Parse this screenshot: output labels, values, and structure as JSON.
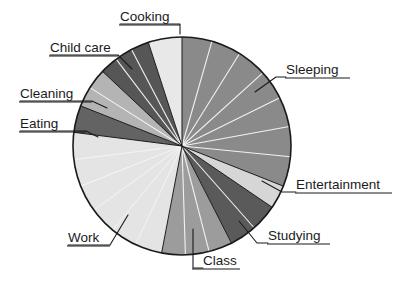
{
  "chart_data": {
    "type": "pie",
    "title": "",
    "subtitle": "",
    "xlabel": "",
    "ylabel": "",
    "legend_position": "none",
    "grid": false,
    "units": "percent of day",
    "start_angle_deg": 0,
    "direction": "clockwise",
    "center": {
      "x": 182,
      "y": 146
    },
    "radius": 109,
    "categories": [
      "Sleeping",
      "Entertainment",
      "Studying",
      "Class",
      "Work",
      "Eating",
      "Cleaning",
      "Child care",
      "Cooking"
    ],
    "values": [
      31.0,
      3.5,
      8.0,
      10.5,
      24.0,
      4.0,
      6.0,
      8.0,
      5.0
    ],
    "colors": [
      "#8a8a8a",
      "#d6d6d6",
      "#5a5a5a",
      "#9c9c9c",
      "#e4e4e4",
      "#636363",
      "#b4b4b4",
      "#565656",
      "#e8e8e8"
    ],
    "subslice_counts": [
      7,
      1,
      2,
      3,
      6,
      1,
      2,
      3,
      1
    ],
    "slices": [
      {
        "label": "Sleeping",
        "value": 31.0,
        "color": "#8a8a8a",
        "start_deg": 0,
        "end_deg": 111.6,
        "subslices": 7
      },
      {
        "label": "Entertainment",
        "value": 3.5,
        "color": "#d6d6d6",
        "start_deg": 111.6,
        "end_deg": 124.2,
        "subslices": 1
      },
      {
        "label": "Studying",
        "value": 8.0,
        "color": "#5a5a5a",
        "start_deg": 124.2,
        "end_deg": 153.0,
        "subslices": 2
      },
      {
        "label": "Class",
        "value": 10.5,
        "color": "#9c9c9c",
        "start_deg": 153.0,
        "end_deg": 190.8,
        "subslices": 3
      },
      {
        "label": "Work",
        "value": 24.0,
        "color": "#e4e4e4",
        "start_deg": 190.8,
        "end_deg": 277.2,
        "subslices": 6
      },
      {
        "label": "Eating",
        "value": 4.0,
        "color": "#636363",
        "start_deg": 277.2,
        "end_deg": 291.6,
        "subslices": 1
      },
      {
        "label": "Cleaning",
        "value": 6.0,
        "color": "#b4b4b4",
        "start_deg": 291.6,
        "end_deg": 313.2,
        "subslices": 2
      },
      {
        "label": "Child care",
        "value": 8.0,
        "color": "#565656",
        "start_deg": 313.2,
        "end_deg": 342.0,
        "subslices": 3
      },
      {
        "label": "Cooking",
        "value": 5.0,
        "color": "#e8e8e8",
        "start_deg": 342.0,
        "end_deg": 360.0,
        "subslices": 1
      }
    ]
  },
  "labels": {
    "cooking": "Cooking",
    "child_care": "Child care",
    "cleaning": "Cleaning",
    "eating": "Eating",
    "work": "Work",
    "class": "Class",
    "studying": "Studying",
    "entertainment": "Entertainment",
    "sleeping": "Sleeping"
  },
  "style": {
    "background": "#ffffff",
    "text_color": "#1b1b1b",
    "outline_color": "#1b1b1b",
    "divider_color": "#f2f2f2"
  }
}
